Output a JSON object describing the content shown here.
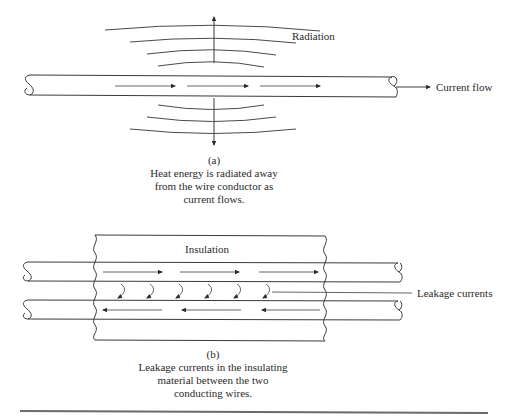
{
  "figure_a": {
    "label_radiation": "Radiation",
    "label_current_flow": "Current flow",
    "caption_tag": "(a)",
    "caption_lines": [
      "Heat energy is radiated away",
      "from the wire conductor as",
      "current flows."
    ]
  },
  "figure_b": {
    "label_insulation": "Insulation",
    "label_leakage": "Leakage currents",
    "caption_tag": "(b)",
    "caption_lines": [
      "Leakage currents in the insulating",
      "material between the two",
      "conducting wires."
    ]
  },
  "colors": {
    "line": "#3a3a3a",
    "text": "#2a2a2a",
    "background": "#ffffff",
    "rule": "#6a6a6a"
  }
}
